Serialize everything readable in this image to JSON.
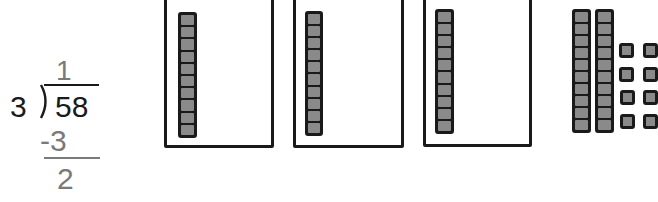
{
  "problem": {
    "divisor": "3",
    "dividend": "58",
    "quotient_digit": "1",
    "subtract": "-3",
    "remainder_tens": "2"
  },
  "model": {
    "groups": 3,
    "tens_per_group": 1,
    "leftover_tens": 2,
    "leftover_ones": 8,
    "cubes_per_rod": 10
  },
  "colors": {
    "ink": "#1a1a1a",
    "work_gray": "#7a7a7a",
    "cube_fill": "#8a8a8a",
    "background": "#ffffff"
  }
}
